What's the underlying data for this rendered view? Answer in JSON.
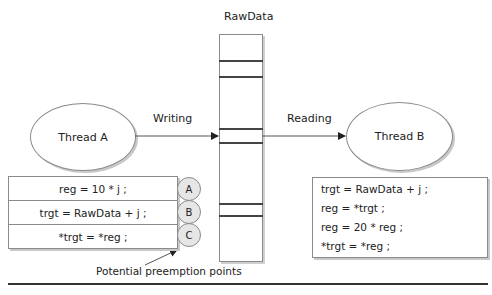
{
  "diagram": {
    "column": {
      "title": "RawData",
      "slots": 6
    },
    "thread_a": {
      "label": "Thread A"
    },
    "thread_b": {
      "label": "Thread B"
    },
    "arrows": {
      "writing": "Writing",
      "reading": "Reading"
    },
    "left_code": [
      "reg  =  10 * j ;",
      "trgt  =  RawData + j ;",
      "*trgt = *reg ;"
    ],
    "preemption_markers": [
      "A",
      "B",
      "C"
    ],
    "preemption_caption": "Potential preemption points",
    "right_code": [
      "trgt  =  RawData + j ;",
      "reg   = *trgt ;",
      "reg = 20 * reg ;",
      "*trgt = *reg ;"
    ]
  }
}
